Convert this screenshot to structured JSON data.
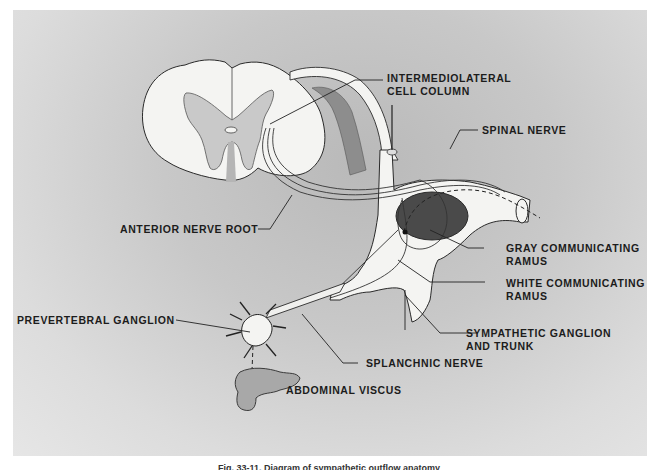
{
  "figure": {
    "caption_partial": "Fig. 33-11. Diagram of sympathetic outflow anatomy",
    "labels": {
      "intermediolateral": [
        "INTERMEDIOLATERAL",
        "CELL COLUMN"
      ],
      "spinal_nerve": [
        "SPINAL NERVE"
      ],
      "gray_ramus": [
        "GRAY COMMUNICATING",
        "RAMUS"
      ],
      "white_ramus": [
        "WHITE COMMUNICATING",
        "RAMUS"
      ],
      "sympathetic_ganglion": [
        "SYMPATHETIC GANGLION",
        "AND TRUNK"
      ],
      "splanchnic_nerve": [
        "SPLANCHNIC NERVE"
      ],
      "abdominal_viscus": [
        "ABDOMINAL VISCUS"
      ],
      "anterior_root": [
        "ANTERIOR NERVE ROOT"
      ],
      "prevertebral": [
        "PREVERTEBRAL GANGLION"
      ]
    },
    "colors": {
      "background_panel": "#c8c8c8",
      "white_matter": "#f4f4f2",
      "gray_matter": "#c9c9c9",
      "dark_hole": "#4a4a4a",
      "outline": "#2a2a2a"
    }
  }
}
